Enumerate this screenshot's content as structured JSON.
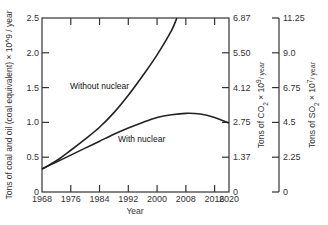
{
  "chart_data": {
    "type": "line",
    "title": "",
    "xlabel": "Year",
    "ylabel": "Tons of coal and oil (coal equivalent) × 10^9 / year",
    "xlim": [
      1968,
      2020
    ],
    "ylim": [
      0,
      2.5
    ],
    "x_ticks": [
      1968,
      1976,
      1984,
      1992,
      2000,
      2008,
      2016,
      2020
    ],
    "y_ticks": [
      "0",
      "0.5",
      "1.0",
      "1.5",
      "2.0",
      "2.5"
    ],
    "secondary_axes": [
      {
        "label": "Tons of CO2 × 10^9 / year",
        "label_main": "Tons of CO",
        "label_sub": "2",
        "label_rest": " × 10",
        "label_sup": "9",
        "label_tail": "/ year",
        "ticks": [
          "0",
          "1.37",
          "2.75",
          "4.12",
          "5.50",
          "6.87"
        ]
      },
      {
        "label": "Tons of SO2 × 10^7 / year",
        "label_main": "Tons of SO",
        "label_sub": "2",
        "label_rest": " × 10",
        "label_sup": "7",
        "label_tail": "/ year",
        "ticks": [
          "0",
          "2.25",
          "4.5",
          "6.75",
          "9.0",
          "11.25"
        ]
      }
    ],
    "series": [
      {
        "name": "Without nuclear",
        "x": [
          1968,
          1972,
          1976,
          1980,
          1984,
          1988,
          1992,
          1996,
          2000,
          2004,
          2005.5
        ],
        "values": [
          0.33,
          0.45,
          0.6,
          0.76,
          0.93,
          1.14,
          1.39,
          1.67,
          1.97,
          2.32,
          2.5
        ]
      },
      {
        "name": "With nuclear",
        "x": [
          1968,
          1972,
          1976,
          1980,
          1984,
          1988,
          1992,
          1996,
          2000,
          2004,
          2008,
          2012,
          2016,
          2020
        ],
        "values": [
          0.33,
          0.43,
          0.53,
          0.63,
          0.73,
          0.83,
          0.92,
          1.0,
          1.07,
          1.11,
          1.13,
          1.12,
          1.07,
          0.99
        ]
      }
    ],
    "annotations": [
      "Without nuclear",
      "With nuclear"
    ],
    "grid": false,
    "legend": "inline labels"
  }
}
